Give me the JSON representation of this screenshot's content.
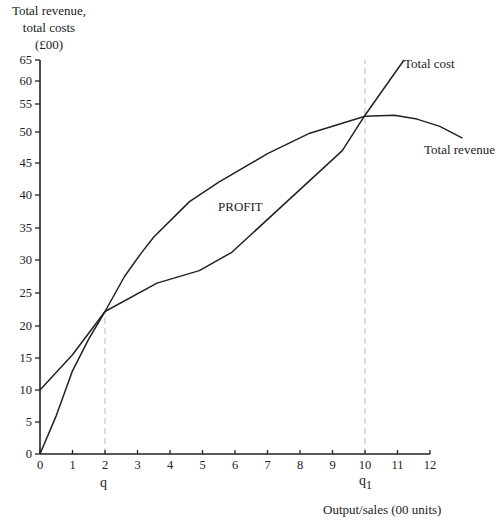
{
  "chart_data": {
    "type": "line",
    "title": "",
    "ylabel": "Total revenue, total costs (£00)",
    "ylabel_lines": [
      "Total revenue,",
      "total costs",
      "(£00)"
    ],
    "xlabel": "Output/sales (00 units)",
    "xlim": [
      0,
      12
    ],
    "ylim": [
      0,
      65
    ],
    "x_ticks": [
      0,
      1,
      2,
      3,
      4,
      5,
      6,
      7,
      8,
      9,
      10,
      11,
      12
    ],
    "y_ticks": [
      0,
      5,
      10,
      15,
      20,
      25,
      30,
      35,
      40,
      45,
      50,
      55,
      60,
      65
    ],
    "grid": false,
    "series": [
      {
        "name": "Total cost",
        "points": [
          [
            0,
            10
          ],
          [
            1,
            15.5
          ],
          [
            2,
            22.2
          ],
          [
            3.6,
            26.5
          ],
          [
            4.9,
            28.4
          ],
          [
            5.9,
            31.2
          ],
          [
            9.3,
            47
          ],
          [
            10,
            53
          ],
          [
            11.2,
            65
          ]
        ]
      },
      {
        "name": "Total revenue",
        "points": [
          [
            0,
            0
          ],
          [
            0.5,
            6
          ],
          [
            1,
            13
          ],
          [
            1.5,
            18
          ],
          [
            2,
            22.2
          ],
          [
            2.6,
            27.5
          ],
          [
            3.1,
            31
          ],
          [
            3.5,
            33.6
          ],
          [
            4.6,
            39
          ],
          [
            5.5,
            42
          ],
          [
            7,
            46.5
          ],
          [
            8.3,
            49.8
          ],
          [
            10,
            52.8
          ],
          [
            10.9,
            53
          ],
          [
            11.6,
            52.3
          ],
          [
            12.3,
            51
          ],
          [
            13,
            49
          ]
        ]
      }
    ],
    "annotations": [
      {
        "text": "PROFIT",
        "x": 6,
        "y": 38
      },
      {
        "text": "Total cost",
        "x": 11.3,
        "y": 65
      },
      {
        "text": "Total revenue",
        "x": 12.8,
        "y": 46.5
      },
      {
        "text": "q",
        "x": 2,
        "below_axis": true
      },
      {
        "text": "q1",
        "x": 10,
        "below_axis": true
      }
    ],
    "reference_lines": [
      {
        "label": "q",
        "x": 2,
        "style": "dashed",
        "from_y": 0,
        "to_y": 22.2
      },
      {
        "label": "q1",
        "x": 10,
        "style": "dashed",
        "from_y": 0,
        "to_y": 65
      }
    ]
  },
  "labels": {
    "ylabel_line1": "Total revenue,",
    "ylabel_line2": "total costs",
    "ylabel_line3": "(£00)",
    "xlabel": "Output/sales (00 units)",
    "profit": "PROFIT",
    "total_cost": "Total cost",
    "total_revenue": "Total revenue",
    "q": "q",
    "q1_base": "q",
    "q1_sub": "1"
  },
  "layout": {
    "x_origin_px": 40,
    "x_unit_px": 32.5,
    "y_tick_px": [
      454,
      422,
      390,
      358,
      326,
      293,
      260,
      228,
      195,
      163,
      132,
      104,
      81,
      60
    ]
  }
}
